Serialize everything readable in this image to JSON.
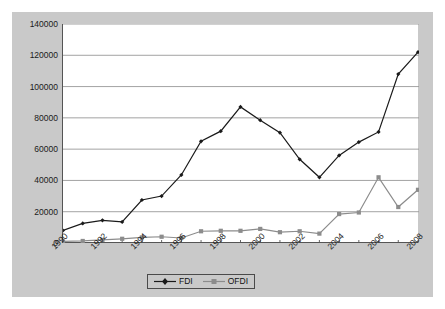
{
  "chart_data": {
    "type": "line",
    "title": "",
    "subtitle": "",
    "xlabel": "",
    "ylabel": "",
    "grid": true,
    "legend_position": "bottom",
    "x": [
      1990,
      1991,
      1992,
      1993,
      1994,
      1995,
      1996,
      1997,
      1998,
      1999,
      2000,
      2001,
      2002,
      2003,
      2004,
      2005,
      2006,
      2007,
      2008
    ],
    "tick_labels": [
      "1990",
      "",
      "1992",
      "",
      "1994",
      "",
      "1996",
      "",
      "1998",
      "",
      "2000",
      "",
      "2002",
      "",
      "2004",
      "",
      "2006",
      "",
      "2008"
    ],
    "visible_tick_labels": [
      "1990",
      "1992",
      "1994",
      "1996",
      "1998",
      "2000",
      "2002",
      "2004",
      "2006",
      "2008"
    ],
    "ylim": [
      0,
      140000
    ],
    "ytick_labels": [
      "140000",
      "120000",
      "100000",
      "80000",
      "60000",
      "40000",
      "20000",
      "0"
    ],
    "yticks": [
      140000,
      120000,
      100000,
      80000,
      60000,
      40000,
      20000,
      0
    ],
    "series": [
      {
        "name": "FDI",
        "color": "#1a1a1a",
        "marker": "diamond",
        "values": [
          8000,
          12500,
          14500,
          13500,
          27500,
          30000,
          43500,
          65000,
          71500,
          87000,
          78500,
          70500,
          53500,
          42000,
          56000,
          64500,
          71000,
          108000,
          122000
        ]
      },
      {
        "name": "OFDI",
        "color": "#8c8c8c",
        "marker": "square",
        "values": [
          1000,
          1300,
          2000,
          2700,
          3600,
          4000,
          3200,
          7500,
          7800,
          7800,
          9000,
          6900,
          7500,
          6000,
          18500,
          19500,
          42000,
          23000,
          34000
        ]
      }
    ]
  },
  "legend": {
    "items": [
      {
        "label": "FDI",
        "marker": "diamond-marker-icon"
      },
      {
        "label": "OFDI",
        "marker": "square-marker-icon"
      }
    ]
  },
  "colors": {
    "chart_background": "#c9c9c9",
    "plot_background": "#ffffff",
    "axis": "#555555",
    "gridline": "#999999",
    "fdi": "#1a1a1a",
    "ofdi": "#8c8c8c"
  }
}
